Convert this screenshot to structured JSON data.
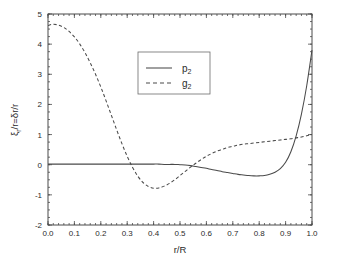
{
  "chart_data": {
    "type": "line",
    "title": "",
    "xlabel": "r/R",
    "ylabel": "ξᵣ/r=δr/r",
    "xlim": [
      0.0,
      1.0
    ],
    "ylim": [
      -2,
      5
    ],
    "grid": false,
    "legend_position": "upper-center",
    "xticks": [
      "0.0",
      "0.1",
      "0.2",
      "0.3",
      "0.4",
      "0.5",
      "0.6",
      "0.7",
      "0.8",
      "0.9",
      "1.0"
    ],
    "xtick_values": [
      0.0,
      0.1,
      0.2,
      0.3,
      0.4,
      0.5,
      0.6,
      0.7,
      0.8,
      0.9,
      1.0
    ],
    "yticks": [
      "5",
      "4",
      "3",
      "2",
      "1",
      "0",
      "-1",
      "-2"
    ],
    "ytick_values": [
      5,
      4,
      3,
      2,
      1,
      0,
      -1,
      -2
    ],
    "x": [
      0.0,
      0.02,
      0.04,
      0.06,
      0.08,
      0.1,
      0.12,
      0.14,
      0.16,
      0.18,
      0.2,
      0.22,
      0.24,
      0.26,
      0.28,
      0.3,
      0.32,
      0.34,
      0.36,
      0.38,
      0.4,
      0.42,
      0.44,
      0.46,
      0.48,
      0.5,
      0.52,
      0.54,
      0.56,
      0.58,
      0.6,
      0.62,
      0.64,
      0.66,
      0.68,
      0.7,
      0.72,
      0.74,
      0.76,
      0.78,
      0.8,
      0.82,
      0.84,
      0.86,
      0.88,
      0.9,
      0.92,
      0.94,
      0.96,
      0.98,
      1.0
    ],
    "series": [
      {
        "name": "p2",
        "label": "p₂",
        "style": "solid",
        "color": "#4a4a4a",
        "values": [
          0.02,
          0.02,
          0.02,
          0.02,
          0.02,
          0.02,
          0.02,
          0.02,
          0.02,
          0.02,
          0.02,
          0.02,
          0.02,
          0.02,
          0.02,
          0.02,
          0.02,
          0.02,
          0.02,
          0.02,
          0.02,
          0.02,
          0.01,
          0.01,
          0.01,
          0.0,
          -0.01,
          -0.03,
          -0.06,
          -0.09,
          -0.12,
          -0.16,
          -0.19,
          -0.23,
          -0.26,
          -0.29,
          -0.32,
          -0.34,
          -0.36,
          -0.37,
          -0.37,
          -0.36,
          -0.32,
          -0.25,
          -0.13,
          0.08,
          0.43,
          0.96,
          1.68,
          2.62,
          3.8
        ]
      },
      {
        "name": "g2",
        "label": "g₂",
        "style": "dashed",
        "color": "#4a4a4a",
        "values": [
          4.62,
          4.66,
          4.63,
          4.55,
          4.42,
          4.24,
          4.01,
          3.72,
          3.38,
          3.0,
          2.58,
          2.12,
          1.64,
          1.16,
          0.7,
          0.28,
          -0.08,
          -0.38,
          -0.59,
          -0.72,
          -0.78,
          -0.77,
          -0.71,
          -0.62,
          -0.5,
          -0.36,
          -0.22,
          -0.08,
          0.05,
          0.17,
          0.28,
          0.37,
          0.45,
          0.51,
          0.57,
          0.61,
          0.65,
          0.68,
          0.7,
          0.72,
          0.74,
          0.76,
          0.78,
          0.8,
          0.82,
          0.84,
          0.86,
          0.89,
          0.92,
          0.96,
          1.0
        ]
      }
    ],
    "annotations": {
      "g2_zero_crossings": [
        0.245,
        0.525
      ],
      "g2_minimum": {
        "x": 0.4,
        "y": -0.78
      },
      "g2_start": {
        "x": 0.0,
        "y": 4.62
      },
      "p2_minimum": {
        "x": 0.78,
        "y": -0.37
      },
      "p2_end": {
        "x": 1.0,
        "y": 3.8
      }
    }
  },
  "legend": {
    "entries": [
      {
        "label_base": "p",
        "label_sub": "2"
      },
      {
        "label_base": "g",
        "label_sub": "2"
      }
    ]
  },
  "axis_labels": {
    "x_title": "r/R",
    "y_title_parts": {
      "xi": "ξ",
      "sub_r": "r",
      "over_r": "/r=",
      "delta": "δ",
      "tail": "r/r"
    }
  }
}
